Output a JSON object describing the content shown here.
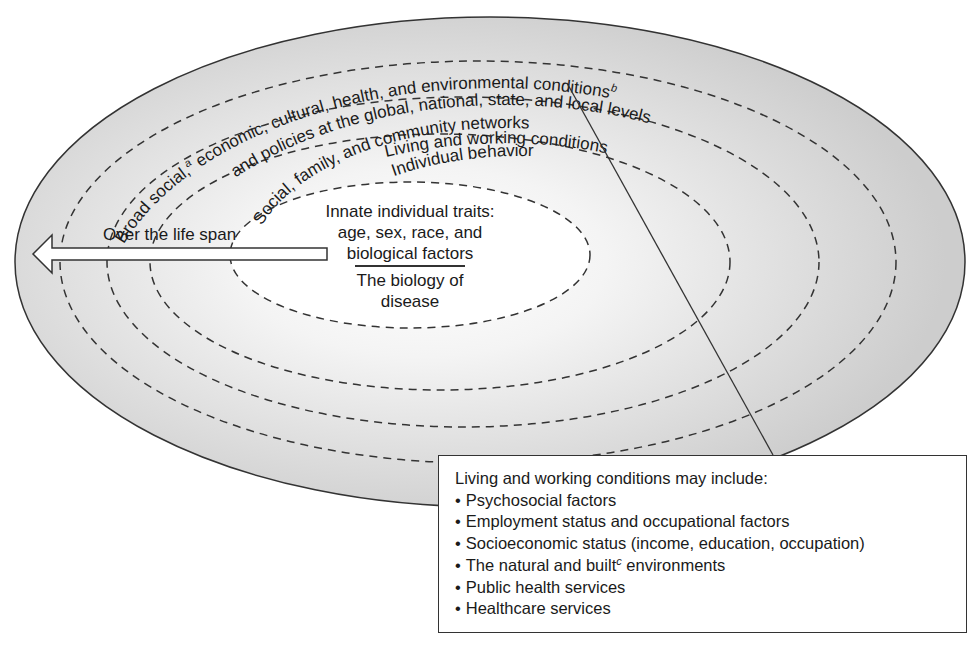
{
  "diagram": {
    "type": "nested-ellipses",
    "layers": [
      {
        "id": "outer",
        "label": "Broad social, economic, cultural, health, and environmental conditions and policies at the global, national, state, and local levels",
        "line1_a": "Broad social,",
        "sup_a": "a",
        "line1_b": " economic, cultural, health, and environmental conditions",
        "sup_b": "b",
        "line2": "and policies at the global, national, state, and local levels"
      },
      {
        "id": "living",
        "label": "Living and working conditions"
      },
      {
        "id": "social",
        "label": "Social, family, and community networks"
      },
      {
        "id": "behavior",
        "label": "Individual behavior"
      },
      {
        "id": "innate",
        "label_lines": [
          "Innate individual traits:",
          "age, sex, race, and",
          "biological factors"
        ],
        "sub_lines": [
          "The biology of",
          "disease"
        ]
      }
    ],
    "arrow": {
      "label": "Over the life span",
      "direction": "left"
    },
    "callout": {
      "heading": "Living and working conditions may include:",
      "items": [
        {
          "text": "Psychosocial factors"
        },
        {
          "text": "Employment status and occupational factors"
        },
        {
          "text": "Socioeconomic status (income, education, occupation)"
        },
        {
          "text_before": "The natural and built",
          "sup": "c",
          "text_after": " environments"
        },
        {
          "text": "Public health services"
        },
        {
          "text": "Healthcare services"
        }
      ]
    },
    "colors": {
      "outer_fill": "#cfcfcf",
      "ring_mid": "#dedede",
      "inner_fill": "#ffffff",
      "stroke": "#333333"
    }
  }
}
